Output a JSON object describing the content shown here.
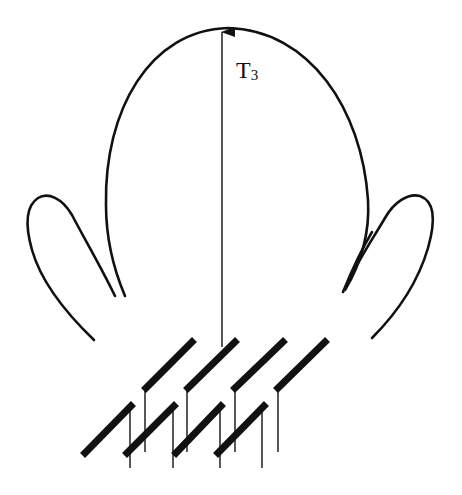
{
  "diagram": {
    "type": "antenna-radiation-pattern",
    "label": {
      "main": "T",
      "subscript": "3"
    },
    "components": {
      "main_lobe": "main-lobe",
      "side_lobes": [
        "left-side-lobe",
        "right-side-lobe"
      ],
      "direction_arrow": "T3 direction",
      "array": {
        "rows": 2,
        "elements_per_row": 4
      }
    },
    "colors": {
      "stroke": "#111111",
      "background": "#ffffff"
    }
  }
}
